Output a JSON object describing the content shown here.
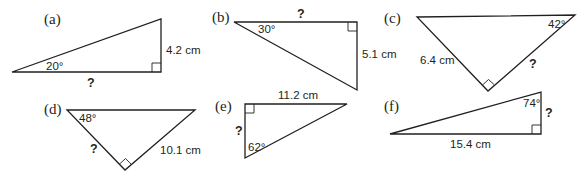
{
  "figure": {
    "stroke_color": "#231f20",
    "background": "#ffffff"
  },
  "triangles": [
    {
      "tag": "(a)",
      "angle": "20°",
      "given_side": "4.2 cm",
      "unknown": "?",
      "points": "12,72 161,72 161,19",
      "right_angle_at": "161,72"
    },
    {
      "tag": "(b)",
      "angle": "30°",
      "given_side": "5.1 cm",
      "unknown": "?",
      "points": "234,22 357,22 357,90",
      "right_angle_at": "357,22"
    },
    {
      "tag": "(c)",
      "angle": "42°",
      "given_side": "6.4 cm",
      "unknown": "?",
      "points": "417,17 575,15 488,91",
      "right_angle_at": "488,91"
    },
    {
      "tag": "(d)",
      "angle": "48°",
      "given_side": "10.1 cm",
      "unknown": "?",
      "points": "67,110 195,110 125,170",
      "right_angle_at": "125,170"
    },
    {
      "tag": "(e)",
      "angle": "62°",
      "given_side": "11.2 cm",
      "unknown": "?",
      "points": "245,104 347,104 245,158",
      "right_angle_at": "245,104"
    },
    {
      "tag": "(f)",
      "angle": "74°",
      "given_side": "15.4 cm",
      "unknown": "?",
      "points": "390,134 541,92 541,134",
      "right_angle_at": "541,134"
    }
  ]
}
